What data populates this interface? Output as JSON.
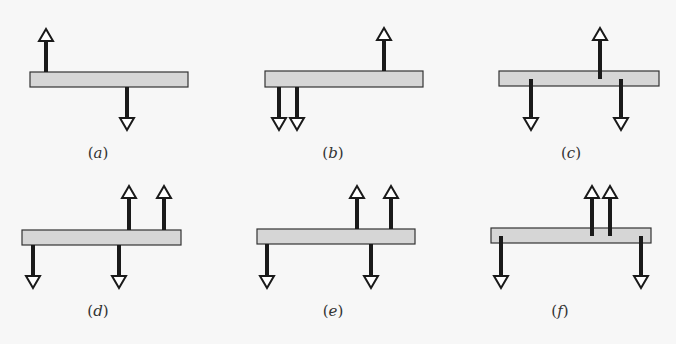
{
  "figure": {
    "colors": {
      "background": "#f7f7f7",
      "bar_fill": "#d6d6d6",
      "bar_stroke": "#333333",
      "arrow": "#1a1a1a",
      "arrowhead_fill": "#ffffff"
    },
    "panels": [
      {
        "id": "a",
        "label_open": "(",
        "label_letter": "a",
        "label_close": ")",
        "bar": {
          "x": 30,
          "y": 72,
          "w": 158,
          "h": 15
        },
        "up_arrows": [
          {
            "x": 46,
            "from": 72,
            "to": 29
          }
        ],
        "down_arrows": [
          {
            "x": 127,
            "from": 87,
            "to": 130
          }
        ],
        "label_pos": {
          "x": 98,
          "y": 158
        }
      },
      {
        "id": "b",
        "label_open": "(",
        "label_letter": "b",
        "label_close": ")",
        "bar": {
          "x": 265,
          "y": 71,
          "w": 158,
          "h": 16
        },
        "up_arrows": [
          {
            "x": 384,
            "from": 71,
            "to": 28
          }
        ],
        "down_arrows": [
          {
            "x": 279,
            "from": 87,
            "to": 130
          },
          {
            "x": 297,
            "from": 87,
            "to": 130
          }
        ],
        "label_pos": {
          "x": 333,
          "y": 158
        }
      },
      {
        "id": "c",
        "label_open": "(",
        "label_letter": "c",
        "label_close": ")",
        "bar": {
          "x": 499,
          "y": 71,
          "w": 160,
          "h": 15
        },
        "up_arrows": [
          {
            "x": 600,
            "from": 79,
            "to": 28
          }
        ],
        "down_arrows": [
          {
            "x": 531,
            "from": 79,
            "to": 130
          },
          {
            "x": 621,
            "from": 79,
            "to": 130
          }
        ],
        "label_pos": {
          "x": 571,
          "y": 158
        }
      },
      {
        "id": "d",
        "label_open": "(",
        "label_letter": "d",
        "label_close": ")",
        "bar": {
          "x": 22,
          "y": 230,
          "w": 159,
          "h": 15
        },
        "up_arrows": [
          {
            "x": 129,
            "from": 230,
            "to": 186
          },
          {
            "x": 164,
            "from": 230,
            "to": 186
          }
        ],
        "down_arrows": [
          {
            "x": 33,
            "from": 245,
            "to": 288
          },
          {
            "x": 119,
            "from": 245,
            "to": 288
          }
        ],
        "label_pos": {
          "x": 98,
          "y": 316
        }
      },
      {
        "id": "e",
        "label_open": "(",
        "label_letter": "e",
        "label_close": ")",
        "bar": {
          "x": 257,
          "y": 229,
          "w": 158,
          "h": 15
        },
        "up_arrows": [
          {
            "x": 357,
            "from": 229,
            "to": 186
          },
          {
            "x": 391,
            "from": 229,
            "to": 186
          }
        ],
        "down_arrows": [
          {
            "x": 267,
            "from": 244,
            "to": 288
          },
          {
            "x": 371,
            "from": 244,
            "to": 288
          }
        ],
        "label_pos": {
          "x": 333,
          "y": 316
        }
      },
      {
        "id": "f",
        "label_open": "(",
        "label_letter": "f",
        "label_close": ")",
        "bar": {
          "x": 491,
          "y": 228,
          "w": 160,
          "h": 15
        },
        "up_arrows": [
          {
            "x": 592,
            "from": 236,
            "to": 186
          },
          {
            "x": 610,
            "from": 236,
            "to": 186
          }
        ],
        "down_arrows": [
          {
            "x": 501,
            "from": 236,
            "to": 288
          },
          {
            "x": 641,
            "from": 236,
            "to": 288
          }
        ],
        "label_pos": {
          "x": 560,
          "y": 316
        }
      }
    ]
  }
}
